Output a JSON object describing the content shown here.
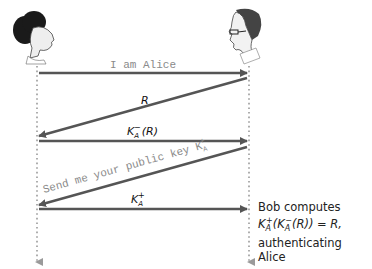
{
  "diagram": {
    "type": "sequence",
    "actors": [
      {
        "name": "Alice",
        "icon": "woman-head-icon"
      },
      {
        "name": "Bob",
        "icon": "man-with-glasses-head-icon"
      }
    ],
    "messages": [
      {
        "from": "Alice",
        "to": "Bob",
        "label": "I am Alice"
      },
      {
        "from": "Bob",
        "to": "Alice",
        "label": "R"
      },
      {
        "from": "Alice",
        "to": "Bob",
        "label": "K_A^-(R)"
      },
      {
        "from": "Bob",
        "to": "Alice",
        "label": "Send me your public key K_A^+"
      },
      {
        "from": "Alice",
        "to": "Bob",
        "label": "K_A^+"
      }
    ],
    "note": {
      "line1": "Bob computes",
      "line2": "K_A^+(K_A^-(R)) = R,",
      "line3": "authenticating Alice"
    },
    "colors": {
      "arrow": "#555555",
      "lifeline": "#9a9a9a",
      "mono_text": "#8a8a8a"
    }
  }
}
